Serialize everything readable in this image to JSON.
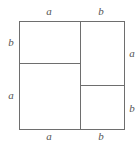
{
  "figure": {
    "kind": "geometric-square-dissection",
    "stroke_color": "#6e6e6e",
    "label_color": "#555555",
    "background_color": "#ffffff"
  },
  "labels": {
    "top_left": "a",
    "top_right": "b",
    "bottom_left": "a",
    "bottom_right": "b",
    "left_upper": "b",
    "left_lower": "a",
    "right_upper": "a",
    "right_lower": "b"
  },
  "chart_data": {
    "type": "diagram",
    "title": "",
    "shape": "square",
    "segments": {
      "top_edge": [
        "a",
        "b"
      ],
      "bottom_edge": [
        "a",
        "b"
      ],
      "left_edge": [
        "b",
        "a"
      ],
      "right_edge": [
        "a",
        "b"
      ]
    },
    "regions": [
      {
        "name": "top-left",
        "width": "a",
        "height": "b",
        "area": "ab"
      },
      {
        "name": "bottom-left",
        "width": "a",
        "height": "a",
        "area": "a^2"
      },
      {
        "name": "top-right",
        "width": "b",
        "height": "a",
        "area": "ab"
      },
      {
        "name": "bottom-right",
        "width": "b",
        "height": "b",
        "area": "b^2"
      }
    ],
    "interior_lines": [
      {
        "orientation": "vertical",
        "spans": "full height",
        "position": "after segment a on top edge"
      },
      {
        "orientation": "horizontal",
        "spans": "left column",
        "position": "after segment b on left edge"
      },
      {
        "orientation": "horizontal",
        "spans": "right column",
        "position": "after segment a on right edge"
      }
    ]
  }
}
